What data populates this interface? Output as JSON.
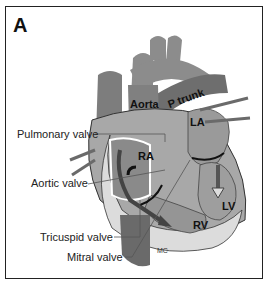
{
  "figure": {
    "panel_label": "A",
    "structures": {
      "aorta": "Aorta",
      "pulmonary_trunk": "P trunk",
      "left_atrium": "LA",
      "right_atrium": "RA",
      "left_ventricle": "LV",
      "right_ventricle": "RV",
      "mc": "MC"
    },
    "callouts": [
      {
        "label": "Pulmonary valve"
      },
      {
        "label": "Aortic valve"
      },
      {
        "label": "Tricuspid valve"
      },
      {
        "label": "Mitral valve"
      }
    ],
    "colors": {
      "tissue_dark": "#6e6e6e",
      "tissue_mid": "#8c8c8c",
      "tissue_light": "#bdbdbd",
      "outline": "#222222",
      "background": "#ffffff"
    }
  }
}
